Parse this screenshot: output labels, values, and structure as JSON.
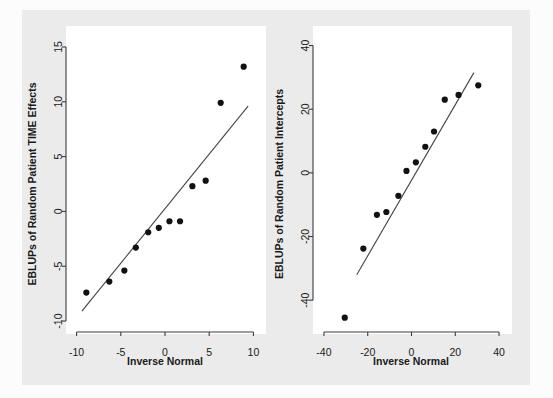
{
  "figure": {
    "background_color": "#fcfcfc",
    "panel_color": "#ebebeb",
    "plot_area_color": "#ffffff",
    "point_color": "#111111",
    "line_color": "#444444",
    "axis_color": "#3c3c3c",
    "width": 553,
    "height": 398
  },
  "chart_data": [
    {
      "type": "scatter",
      "title": "",
      "xlabel": "Inverse Normal",
      "ylabel": "EBLUPs of Random Patient TIME Effects",
      "xlim": [
        -11.2,
        11.2
      ],
      "ylim": [
        -11.0,
        16.0
      ],
      "xticks": [
        -10,
        -5,
        0,
        5,
        10
      ],
      "xticklabels": [
        "-10",
        "-5",
        "0",
        "5",
        "10"
      ],
      "yticks": [
        -10,
        -5,
        0,
        5,
        10,
        15
      ],
      "yticklabels": [
        "-10",
        "-5",
        "0",
        "5",
        "10",
        "15"
      ],
      "grid": false,
      "legend": "none",
      "x": [
        -8.9,
        -6.3,
        -4.6,
        -3.3,
        -1.9,
        -0.7,
        0.5,
        1.7,
        3.1,
        4.6,
        6.3,
        8.9
      ],
      "y": [
        -7.4,
        -6.4,
        -5.4,
        -3.3,
        -1.9,
        -1.5,
        -0.9,
        -0.9,
        2.3,
        2.8,
        9.9,
        13.2
      ],
      "reference_line": {
        "x0": -9.4,
        "y0": -9.1,
        "x1": 9.4,
        "y1": 9.6
      }
    },
    {
      "type": "scatter",
      "title": "",
      "xlabel": "Inverse Normal",
      "ylabel": "EBLUPs of Random Patient Intercepts",
      "xlim": [
        -45.0,
        45.0
      ],
      "ylim": [
        -50.0,
        43.0
      ],
      "xticks": [
        -40,
        -20,
        0,
        20,
        40
      ],
      "xticklabels": [
        "-40",
        "-20",
        "0",
        "20",
        "40"
      ],
      "yticks": [
        -40,
        -20,
        0,
        20,
        40
      ],
      "yticklabels": [
        "-40",
        "-20",
        "0",
        "20",
        "40"
      ],
      "grid": false,
      "legend": "none",
      "x": [
        -30.5,
        -22.0,
        -15.8,
        -11.5,
        -6.0,
        -2.3,
        2.0,
        6.3,
        10.3,
        15.2,
        21.5,
        30.5
      ],
      "y": [
        -45.5,
        -23.8,
        -13.2,
        -12.3,
        -7.2,
        0.6,
        3.3,
        8.2,
        13.0,
        23.0,
        24.5,
        27.5
      ],
      "reference_line": {
        "x0": -25.0,
        "y0": -32.0,
        "x1": 28.5,
        "y1": 31.5
      }
    }
  ]
}
